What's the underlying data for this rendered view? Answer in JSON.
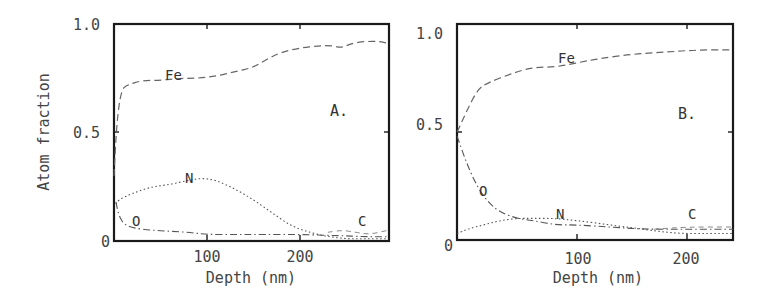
{
  "chart_data": [
    {
      "type": "line",
      "panel": "A.",
      "title": "",
      "xlabel": "Depth (nm)",
      "ylabel": "Atom fraction",
      "xlim": [
        0,
        295
      ],
      "ylim": [
        0,
        1.0
      ],
      "xticks": [
        100,
        200
      ],
      "xtick_labels": [
        "100",
        "200"
      ],
      "yticks": [
        0,
        0.5,
        1.0
      ],
      "ytick_labels": [
        "0",
        "0.5",
        "1.0"
      ],
      "grid": false,
      "legend": "inline labels",
      "series": [
        {
          "name": "Fe",
          "style": "dashed",
          "x": [
            0,
            3,
            8,
            15,
            30,
            50,
            70,
            90,
            110,
            130,
            150,
            165,
            180,
            200,
            220,
            235,
            245,
            255,
            270,
            285,
            295
          ],
          "y": [
            0.3,
            0.55,
            0.7,
            0.72,
            0.74,
            0.74,
            0.75,
            0.75,
            0.76,
            0.78,
            0.8,
            0.84,
            0.87,
            0.89,
            0.9,
            0.9,
            0.89,
            0.91,
            0.92,
            0.92,
            0.91
          ]
        },
        {
          "name": "N",
          "style": "dotted",
          "x": [
            2,
            5,
            20,
            40,
            60,
            80,
            95,
            110,
            130,
            150,
            170,
            190,
            210,
            230,
            250,
            270,
            295
          ],
          "y": [
            0.17,
            0.19,
            0.22,
            0.25,
            0.26,
            0.28,
            0.29,
            0.28,
            0.24,
            0.19,
            0.13,
            0.07,
            0.04,
            0.02,
            0.01,
            0.01,
            0.01
          ]
        },
        {
          "name": "O",
          "style": "dash-dot",
          "x": [
            2,
            5,
            10,
            20,
            40,
            60,
            80,
            100,
            130,
            160,
            200,
            240,
            270,
            295
          ],
          "y": [
            0.18,
            0.12,
            0.08,
            0.06,
            0.05,
            0.045,
            0.04,
            0.03,
            0.03,
            0.03,
            0.03,
            0.025,
            0.02,
            0.02
          ]
        },
        {
          "name": "C",
          "style": "dashed-light",
          "x": [
            230,
            245,
            260,
            275,
            295
          ],
          "y": [
            0.04,
            0.05,
            0.04,
            0.03,
            0.05
          ]
        }
      ],
      "annotations": [
        {
          "text": "Fe",
          "x": 60,
          "y": 0.77
        },
        {
          "text": "N",
          "x": 82,
          "y": 0.3
        },
        {
          "text": "O",
          "x": 22,
          "y": 0.08
        },
        {
          "text": "C",
          "x": 265,
          "y": 0.08
        },
        {
          "text": "A.",
          "x": 240,
          "y": 0.6
        }
      ]
    },
    {
      "type": "line",
      "panel": "B.",
      "title": "",
      "xlabel": "Depth (nm)",
      "ylabel": "",
      "xlim": [
        -9,
        242
      ],
      "ylim": [
        0,
        1.0
      ],
      "xticks": [
        100,
        200
      ],
      "xtick_labels": [
        "100",
        "200"
      ],
      "yticks": [
        0,
        0.5,
        1.0
      ],
      "ytick_labels": [
        "0",
        "0.5",
        "1.0"
      ],
      "grid": false,
      "legend": "inline labels",
      "series": [
        {
          "name": "Fe",
          "style": "dashed",
          "x": [
            -9,
            0,
            10,
            20,
            40,
            60,
            80,
            100,
            120,
            150,
            180,
            210,
            242
          ],
          "y": [
            0.5,
            0.6,
            0.7,
            0.73,
            0.77,
            0.8,
            0.8,
            0.82,
            0.84,
            0.86,
            0.87,
            0.88,
            0.88
          ]
        },
        {
          "name": "O",
          "style": "dash-dot",
          "x": [
            -9,
            0,
            10,
            20,
            30,
            45,
            60,
            80,
            100,
            130,
            160,
            200,
            242
          ],
          "y": [
            0.48,
            0.35,
            0.24,
            0.17,
            0.13,
            0.1,
            0.09,
            0.07,
            0.07,
            0.06,
            0.05,
            0.05,
            0.05
          ]
        },
        {
          "name": "N",
          "style": "dotted",
          "x": [
            -9,
            0,
            15,
            30,
            45,
            60,
            80,
            100,
            130,
            160,
            190,
            220,
            242
          ],
          "y": [
            0.03,
            0.05,
            0.07,
            0.09,
            0.1,
            0.1,
            0.1,
            0.09,
            0.07,
            0.05,
            0.03,
            0.03,
            0.03
          ]
        },
        {
          "name": "C",
          "style": "dashed-light",
          "x": [
            170,
            200,
            242
          ],
          "y": [
            0.05,
            0.06,
            0.06
          ]
        }
      ],
      "annotations": [
        {
          "text": "Fe",
          "x": 90,
          "y": 0.85
        },
        {
          "text": "O",
          "x": 14,
          "y": 0.23
        },
        {
          "text": "N",
          "x": 88,
          "y": 0.12
        },
        {
          "text": "C",
          "x": 205,
          "y": 0.12
        },
        {
          "text": "B.",
          "x": 200,
          "y": 0.58
        }
      ]
    }
  ],
  "labels": {
    "y_axis_title": "Atom fraction",
    "x_axis_title_a": "Depth (nm)",
    "x_axis_title_b": "Depth (nm)",
    "panel_a": "A.",
    "panel_b": "B.",
    "y_ticks": [
      "1.0",
      "0.5",
      "0"
    ],
    "x_ticks": [
      "100",
      "200"
    ],
    "curves": {
      "fe": "Fe",
      "n": "N",
      "o": "O",
      "c": "C"
    }
  }
}
